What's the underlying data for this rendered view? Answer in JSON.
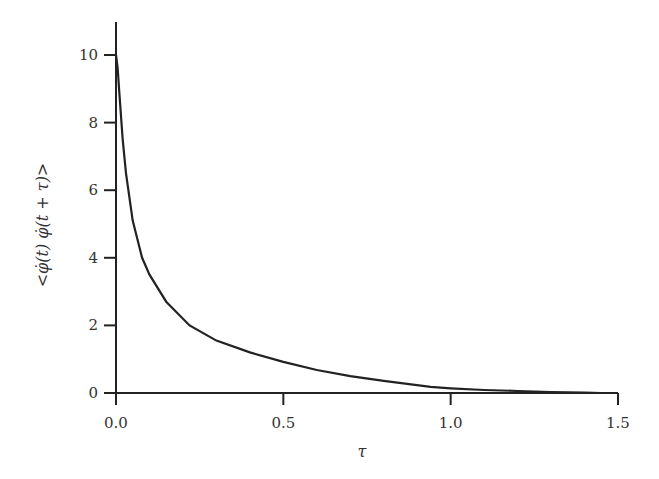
{
  "chart_data": {
    "type": "line",
    "title": "",
    "xlabel": "τ",
    "ylabel": "<φ̇(t) φ̇(t + τ)>",
    "xlim": [
      0,
      1.5
    ],
    "ylim": [
      0,
      11
    ],
    "grid": false,
    "legend": null,
    "x_ticks": [
      "0.0",
      "0.5",
      "1.0",
      "1.5"
    ],
    "y_ticks": [
      "0",
      "2",
      "4",
      "6",
      "8",
      "10"
    ],
    "series": [
      {
        "name": "autocorrelation",
        "color": "#222222",
        "x": [
          0.0,
          0.005,
          0.01,
          0.02,
          0.03,
          0.05,
          0.078,
          0.1,
          0.15,
          0.22,
          0.3,
          0.4,
          0.5,
          0.6,
          0.7,
          0.8,
          0.94,
          1.0,
          1.1,
          1.2,
          1.3,
          1.4,
          1.45
        ],
        "y": [
          10.0,
          9.6,
          8.9,
          7.5,
          6.5,
          5.1,
          4.0,
          3.5,
          2.7,
          2.0,
          1.55,
          1.2,
          0.92,
          0.68,
          0.5,
          0.36,
          0.18,
          0.14,
          0.09,
          0.06,
          0.03,
          0.01,
          0.0
        ]
      }
    ]
  }
}
